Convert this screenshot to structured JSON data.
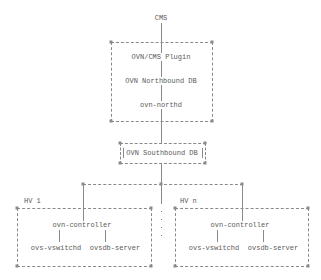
{
  "diagram": {
    "top_label": "CMS",
    "central_box": {
      "items": [
        "OVN/CMS Plugin",
        "OVN Northbound DB",
        "ovn-northd"
      ]
    },
    "southbound_box": {
      "label": "OVN Southbound DB"
    },
    "hypervisors": [
      {
        "label": "HV 1",
        "controller": "ovn-controller",
        "components": [
          "ovs-vswitchd",
          "ovsdb-server"
        ]
      },
      {
        "label": "HV n",
        "controller": "ovn-controller",
        "components": [
          "ovs-vswitchd",
          "ovsdb-server"
        ]
      }
    ],
    "ellipsis": "..."
  }
}
